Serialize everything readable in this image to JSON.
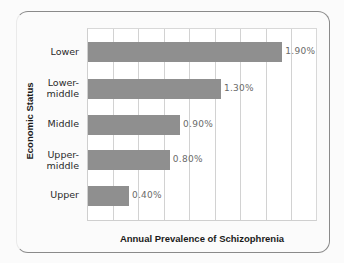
{
  "chart_data": {
    "type": "bar",
    "orientation": "horizontal",
    "title": "",
    "xlabel": "Annual Prevalence of Schizophrenia",
    "ylabel": "Economic Status",
    "categories": [
      "Lower",
      "Lower-middle",
      "Middle",
      "Upper-middle",
      "Upper"
    ],
    "values": [
      1.9,
      1.3,
      0.9,
      0.8,
      0.4
    ],
    "value_labels": [
      "1.90%",
      "1.30%",
      "0.90%",
      "0.80%",
      "0.40%"
    ],
    "unit": "%",
    "xlim": [
      0,
      2.25
    ],
    "grid": {
      "vertical": true,
      "interval": 0.25
    },
    "x_tick_labels": [],
    "legend": null,
    "bar_color": "#8f8f8f"
  },
  "labels": {
    "cat_0_line1": "Lower",
    "cat_1_line1": "Lower-",
    "cat_1_line2": "middle",
    "cat_2_line1": "Middle",
    "cat_3_line1": "Upper-",
    "cat_3_line2": "middle",
    "cat_4_line1": "Upper"
  }
}
